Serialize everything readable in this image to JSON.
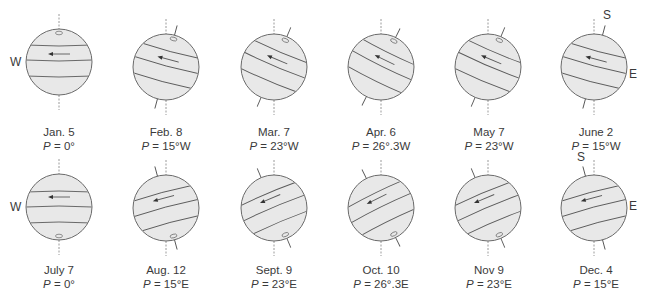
{
  "figure": {
    "colors": {
      "globe_fill": "#e8e8e8",
      "globe_outline": "#6a6a6a",
      "band_line": "#5a5a5a",
      "axis_dashed": "#9a9a9a"
    },
    "rows": [
      {
        "pole_marker": "top",
        "panels": [
          {
            "date": "Jan. 5",
            "p_prefix": "P",
            "p_value": "= 0°",
            "angle": 0,
            "dir": "W",
            "cx": 59,
            "cy": 62
          },
          {
            "date": "Feb. 8",
            "p_prefix": "P",
            "p_value": "= 15°W",
            "angle": 15,
            "dir": "W",
            "cx": 166,
            "cy": 67
          },
          {
            "date": "Mar. 7",
            "p_prefix": "P",
            "p_value": "= 23°W",
            "angle": 23,
            "dir": "W",
            "cx": 274,
            "cy": 67
          },
          {
            "date": "Apr. 6",
            "p_prefix": "P",
            "p_value": "= 26°.3W",
            "angle": 26.3,
            "dir": "W",
            "cx": 381,
            "cy": 67
          },
          {
            "date": "May 7",
            "p_prefix": "P",
            "p_value": "= 23°W",
            "angle": 23,
            "dir": "W",
            "cx": 488,
            "cy": 67
          },
          {
            "date": "June 2",
            "p_prefix": "P",
            "p_value": "= 15°W",
            "angle": 15,
            "dir": "W",
            "cx": 594,
            "cy": 67
          }
        ]
      },
      {
        "pole_marker": "bottom",
        "panels": [
          {
            "date": "July 7",
            "p_prefix": "P",
            "p_value": "= 0°",
            "angle": 0,
            "dir": "E",
            "cx": 59,
            "cy": 207
          },
          {
            "date": "Aug. 12",
            "p_prefix": "P",
            "p_value": "= 15°E",
            "angle": -15,
            "dir": "E",
            "cx": 166,
            "cy": 208
          },
          {
            "date": "Sept. 9",
            "p_prefix": "P",
            "p_value": "= 23°E",
            "angle": -23,
            "dir": "E",
            "cx": 274,
            "cy": 208
          },
          {
            "date": "Oct. 10",
            "p_prefix": "P",
            "p_value": "= 26°.3E",
            "angle": -26.3,
            "dir": "E",
            "cx": 381,
            "cy": 208
          },
          {
            "date": "Nov 9",
            "p_prefix": "P",
            "p_value": "= 23°E",
            "angle": -23,
            "dir": "E",
            "cx": 488,
            "cy": 208
          },
          {
            "date": "Dec. 4",
            "p_prefix": "P",
            "p_value": "= 15°E",
            "angle": -15,
            "dir": "E",
            "cx": 594,
            "cy": 208
          }
        ]
      }
    ],
    "direction_labels": [
      {
        "text": "W",
        "x": 10,
        "y": 55
      },
      {
        "text": "S",
        "x": 603,
        "y": 8
      },
      {
        "text": "E",
        "x": 629,
        "y": 67
      },
      {
        "text": "W",
        "x": 10,
        "y": 200
      },
      {
        "text": "S",
        "x": 577,
        "y": 150
      },
      {
        "text": "E",
        "x": 629,
        "y": 199
      }
    ],
    "label_positions": {
      "row0_date_y": 125,
      "row0_p_y": 140,
      "row1_date_y": 263,
      "row1_p_y": 277
    }
  }
}
